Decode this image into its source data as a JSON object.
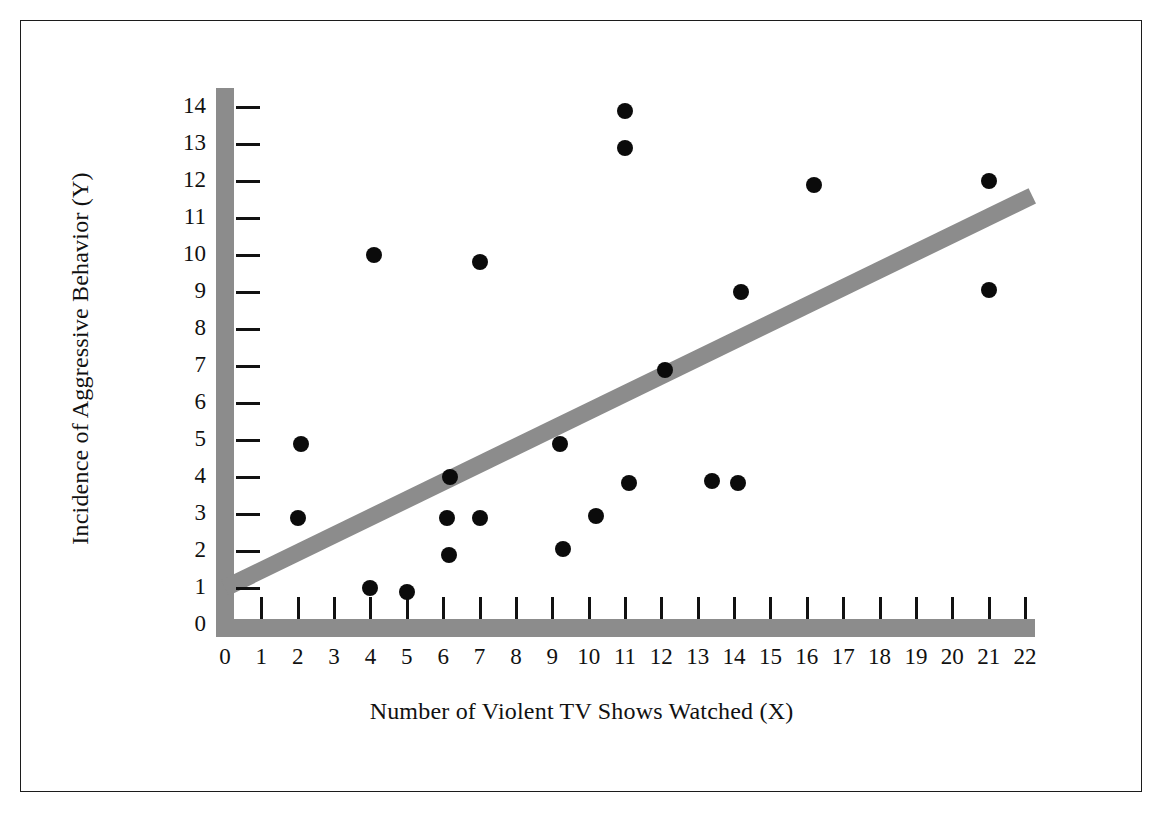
{
  "chart_data": {
    "type": "scatter",
    "title": "",
    "xlabel": "Number of Violent TV Shows Watched (X)",
    "ylabel": "Incidence of Aggressive Behavior (Y)",
    "xlim": [
      0,
      22
    ],
    "ylim": [
      0,
      14
    ],
    "xticks": [
      0,
      1,
      2,
      3,
      4,
      5,
      6,
      7,
      8,
      9,
      10,
      11,
      12,
      13,
      14,
      15,
      16,
      17,
      18,
      19,
      20,
      21,
      22
    ],
    "yticks": [
      0,
      1,
      2,
      3,
      4,
      5,
      6,
      7,
      8,
      9,
      10,
      11,
      12,
      13,
      14
    ],
    "xtick_labels": [
      "0",
      "1",
      "2",
      "3",
      "4",
      "5",
      "6",
      "7",
      "8",
      "9",
      "10",
      "11",
      "12",
      "13",
      "14",
      "15",
      "16",
      "17",
      "18",
      "19",
      "20",
      "21",
      "22"
    ],
    "ytick_labels": [
      "0",
      "1",
      "2",
      "3",
      "4",
      "5",
      "6",
      "7",
      "8",
      "9",
      "10",
      "11",
      "12",
      "13",
      "14"
    ],
    "grid": false,
    "legend": null,
    "marker_color": "#0b0b0b",
    "axis_color": "#8c8c8c",
    "trendline_color": "#8c8c8c",
    "frame_color": "#1c1c1c",
    "points": [
      {
        "x": 2.0,
        "y": 2.9
      },
      {
        "x": 2.1,
        "y": 4.9
      },
      {
        "x": 4.0,
        "y": 1.0
      },
      {
        "x": 4.1,
        "y": 10.0
      },
      {
        "x": 5.0,
        "y": 0.9
      },
      {
        "x": 6.1,
        "y": 2.9
      },
      {
        "x": 6.15,
        "y": 1.9
      },
      {
        "x": 6.2,
        "y": 4.0
      },
      {
        "x": 7.0,
        "y": 2.9
      },
      {
        "x": 7.0,
        "y": 9.8
      },
      {
        "x": 9.2,
        "y": 4.9
      },
      {
        "x": 9.3,
        "y": 2.05
      },
      {
        "x": 10.2,
        "y": 2.95
      },
      {
        "x": 11.0,
        "y": 13.9
      },
      {
        "x": 11.0,
        "y": 12.9
      },
      {
        "x": 11.1,
        "y": 3.85
      },
      {
        "x": 12.1,
        "y": 6.9
      },
      {
        "x": 13.4,
        "y": 3.9
      },
      {
        "x": 14.1,
        "y": 3.85
      },
      {
        "x": 14.2,
        "y": 9.0
      },
      {
        "x": 16.2,
        "y": 11.9
      },
      {
        "x": 21.0,
        "y": 12.0
      },
      {
        "x": 21.0,
        "y": 9.05
      }
    ],
    "trendline": {
      "x0": 0.0,
      "y0": 1.0,
      "x1": 22.2,
      "y1": 11.6,
      "thickness_px": 17
    }
  }
}
